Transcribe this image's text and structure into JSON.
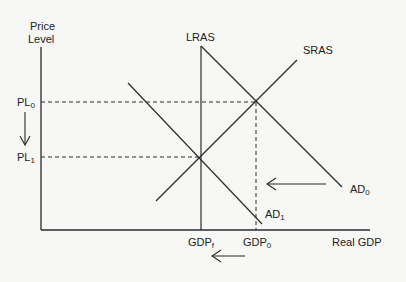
{
  "axes": {
    "y_label_line1": "Price",
    "y_label_line2": "Level",
    "x_label": "Real GDP"
  },
  "curves": {
    "lras": "LRAS",
    "sras": "SRAS",
    "ad0": {
      "base": "AD",
      "sub": "0"
    },
    "ad1": {
      "base": "AD",
      "sub": "1"
    }
  },
  "price_levels": {
    "pl0": {
      "base": "PL",
      "sub": "0"
    },
    "pl1": {
      "base": "PL",
      "sub": "1"
    }
  },
  "gdp_levels": {
    "gdpf": {
      "base": "GDP",
      "sub": "f"
    },
    "gdp0": {
      "base": "GDP",
      "sub": "0"
    }
  },
  "colors": {
    "line": "#2b2b2b",
    "background": "#f7f7f5"
  }
}
